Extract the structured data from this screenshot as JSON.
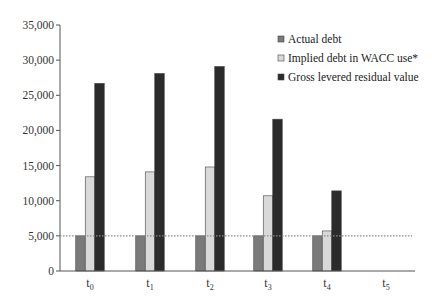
{
  "chart_data": {
    "type": "bar",
    "title": "",
    "xlabel": "",
    "ylabel": "",
    "ylim": [
      0,
      35000
    ],
    "yticks": [
      0,
      5000,
      10000,
      15000,
      20000,
      25000,
      30000,
      35000
    ],
    "ytick_labels": [
      "0",
      "5,000",
      "10,000",
      "15,000",
      "20,000",
      "25,000",
      "30,000",
      "35,000"
    ],
    "categories": [
      "t0",
      "t1",
      "t2",
      "t3",
      "t4",
      "t5"
    ],
    "category_labels": [
      {
        "base": "t",
        "sub": "0"
      },
      {
        "base": "t",
        "sub": "1"
      },
      {
        "base": "t",
        "sub": "2"
      },
      {
        "base": "t",
        "sub": "3"
      },
      {
        "base": "t",
        "sub": "4"
      },
      {
        "base": "t",
        "sub": "5"
      }
    ],
    "series": [
      {
        "name": "Actual debt",
        "color": "#7a7a7a",
        "values": [
          5000,
          5000,
          5000,
          5000,
          5000,
          0
        ]
      },
      {
        "name": "Implied debt in WACC use*",
        "color": "#d9d9d9",
        "values": [
          13400,
          14100,
          14800,
          10700,
          5700,
          0
        ]
      },
      {
        "name": "Gross levered residual value",
        "color": "#2b2b2b",
        "values": [
          26700,
          28100,
          29100,
          21600,
          11400,
          0
        ]
      }
    ],
    "reference_line": {
      "value": 5000,
      "style": "dotted",
      "color": "#888888"
    },
    "grid": false,
    "legend_position": "top-right"
  }
}
